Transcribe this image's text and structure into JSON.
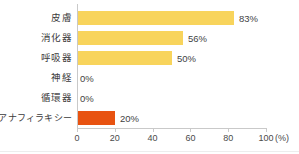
{
  "chart_data": {
    "type": "bar",
    "orientation": "horizontal",
    "title": "",
    "xlabel": "(%)",
    "ylabel": "",
    "xlim": [
      0,
      100
    ],
    "grid": false,
    "legend": false,
    "categories": [
      "皮膚",
      "消化器",
      "呼吸器",
      "神経",
      "循環器",
      "アナフィラキシー"
    ],
    "values": [
      83,
      56,
      50,
      0,
      0,
      20
    ],
    "value_labels": [
      "83%",
      "56%",
      "50%",
      "0%",
      "0%",
      "20%"
    ],
    "bar_colors": [
      "#F8D45C",
      "#F8D45C",
      "#F8D45C",
      "#F8D45C",
      "#F8D45C",
      "#E85311"
    ],
    "xticks": [
      0,
      20,
      40,
      60,
      80,
      100
    ],
    "xtick_labels": [
      "0",
      "20",
      "40",
      "60",
      "80",
      "100"
    ],
    "unit_label": "(%)"
  },
  "colors": {
    "bar_yellow": "#F8D45C",
    "bar_orange": "#E85311",
    "axis": "#c9c9c9",
    "text": "#3b3b3b",
    "background": "#ffffff"
  }
}
